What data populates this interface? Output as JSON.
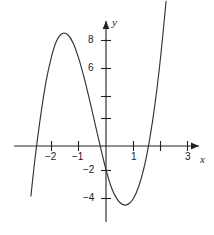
{
  "figure": {
    "background_color": "#ffffff",
    "curve_color": "#333333",
    "axis_color": "#222222"
  },
  "axes": {
    "x_axis_label": "x",
    "y_axis_label": "y"
  },
  "labels": {
    "x": [
      {
        "text": "−2",
        "value": -2,
        "px": 49,
        "py": 156
      },
      {
        "text": "−1",
        "value": -1,
        "px": 73,
        "py": 156
      },
      {
        "text": "1",
        "value": 1,
        "px": 130,
        "py": 156
      },
      {
        "text": "3",
        "value": 3,
        "px": 182,
        "py": 156
      }
    ],
    "y": [
      {
        "text": "8",
        "value": 8,
        "px": 85,
        "py": 36
      },
      {
        "text": "6",
        "value": 6,
        "px": 85,
        "py": 64
      },
      {
        "text": "−2",
        "value": -2,
        "px": 80,
        "py": 164
      },
      {
        "text": "−4",
        "value": -4,
        "px": 80,
        "py": 192
      }
    ]
  },
  "chart_data": {
    "type": "line",
    "title": "",
    "xlabel": "x",
    "ylabel": "y",
    "xlim": [
      -3.0,
      3.2
    ],
    "ylim": [
      -5.5,
      10.0
    ],
    "grid": false,
    "legend": null,
    "x_ticks": [
      -2,
      -1,
      1,
      2,
      3
    ],
    "x_tick_labels": [
      "−2",
      "−1",
      "1",
      "",
      "3"
    ],
    "y_ticks": [
      -4,
      -2,
      2,
      4,
      6,
      8
    ],
    "y_tick_labels": [
      "−4",
      "−2",
      "",
      "",
      "6",
      "8"
    ],
    "roots": [
      -2.55,
      0,
      2.1
    ],
    "local_maximum": {
      "x": -1.55,
      "y": 8.1
    },
    "local_minimum": {
      "x": 1.1,
      "y": -4.0
    },
    "series": [
      {
        "name": "cubic",
        "x": [
          -2.75,
          -2.6,
          -2.4,
          -2.2,
          -2.0,
          -1.8,
          -1.6,
          -1.4,
          -1.2,
          -1.0,
          -0.8,
          -0.6,
          -0.4,
          -0.2,
          0.0,
          0.2,
          0.4,
          0.6,
          0.8,
          1.0,
          1.2,
          1.4,
          1.6,
          1.8,
          2.0,
          2.2,
          2.4,
          2.6,
          2.8
        ],
        "y": [
          -3.6,
          -0.9,
          2.1,
          4.6,
          6.4,
          7.6,
          8.1,
          8.0,
          7.4,
          6.3,
          4.9,
          3.3,
          1.6,
          -0.1,
          -1.7,
          -3.0,
          -3.8,
          -4.2,
          -4.2,
          -3.8,
          -2.9,
          -1.5,
          0.5,
          3.1,
          6.4,
          10.4,
          15.1,
          20.6,
          27.0
        ]
      }
    ]
  }
}
